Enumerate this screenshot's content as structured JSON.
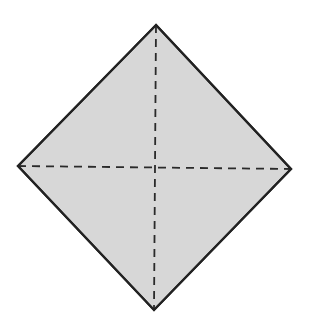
{
  "diagram": {
    "shape": "square rotated 45 degrees (diamond) with dashed diagonals",
    "colors": {
      "background": "#ffffff",
      "fill": "#d7d7d7",
      "outline": "#222222",
      "fold_lines": "#2a2a2a"
    },
    "vertices": {
      "top": [
        156,
        25
      ],
      "right": [
        291,
        169
      ],
      "bottom": [
        154,
        310
      ],
      "left": [
        18,
        166
      ]
    },
    "fold_lines": [
      {
        "name": "vertical-diagonal",
        "from": [
          156,
          25
        ],
        "to": [
          154,
          310
        ],
        "style": "dashed"
      },
      {
        "name": "horizontal-diagonal",
        "from": [
          18,
          166
        ],
        "to": [
          291,
          169
        ],
        "style": "dashed"
      }
    ],
    "outline_width": 2.2,
    "dash_pattern": "8 6"
  }
}
